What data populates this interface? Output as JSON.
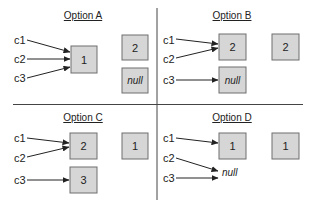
{
  "colors": {
    "box_fill": "#d6d6d6",
    "box_border": "#6e6e6e",
    "line": "#222222"
  },
  "options": [
    {
      "title": "Option A",
      "refs": [
        "c1",
        "c2",
        "c3"
      ],
      "boxes": [
        {
          "value": "1",
          "italic": false
        },
        {
          "value": "2",
          "italic": false
        },
        {
          "value": "null",
          "italic": true
        }
      ],
      "edges": [
        {
          "from": "c1",
          "to": "1"
        },
        {
          "from": "c2",
          "to": "1"
        },
        {
          "from": "c3",
          "to": "1"
        }
      ]
    },
    {
      "title": "Option B",
      "refs": [
        "c1",
        "c2",
        "c3"
      ],
      "boxes": [
        {
          "value": "2",
          "italic": false
        },
        {
          "value": "null",
          "italic": true
        },
        {
          "value": "2",
          "italic": false
        }
      ],
      "edges": [
        {
          "from": "c1",
          "to": "2"
        },
        {
          "from": "c2",
          "to": "2"
        },
        {
          "from": "c3",
          "to": "null"
        }
      ]
    },
    {
      "title": "Option C",
      "refs": [
        "c1",
        "c2",
        "c3"
      ],
      "boxes": [
        {
          "value": "2",
          "italic": false
        },
        {
          "value": "3",
          "italic": false
        },
        {
          "value": "1",
          "italic": false
        }
      ],
      "edges": [
        {
          "from": "c1",
          "to": "2"
        },
        {
          "from": "c2",
          "to": "2"
        },
        {
          "from": "c3",
          "to": "3"
        }
      ]
    },
    {
      "title": "Option D",
      "refs": [
        "c1",
        "c2",
        "c3"
      ],
      "boxes": [
        {
          "value": "1",
          "italic": false
        },
        {
          "value": "1",
          "italic": false
        }
      ],
      "null_label": "null",
      "edges": [
        {
          "from": "c1",
          "to": "1"
        },
        {
          "from": "c2",
          "to": "null"
        },
        {
          "from": "c3",
          "to": "null"
        }
      ]
    }
  ]
}
